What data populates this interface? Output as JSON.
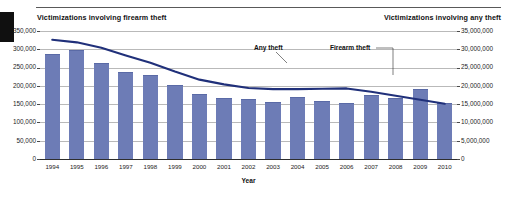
{
  "figure": {
    "left_axis_title": "Victimizations involving firearm theft",
    "right_axis_title": "Victimizations involving any theft",
    "xlabel": "Year",
    "annotations": {
      "line_series": "Any theft",
      "bar_series": "Firearm theft"
    },
    "colors": {
      "bar": "#6d7cb6",
      "line": "#20307a",
      "grid": "#b9b9b9",
      "axis": "#2e2e2e",
      "text": "#111111"
    }
  },
  "chart_data": {
    "type": "bar",
    "title": "",
    "xlabel": "Year",
    "categories": [
      "1994",
      "1995",
      "1996",
      "1997",
      "1998",
      "1999",
      "2000",
      "2001",
      "2002",
      "2003",
      "2004",
      "2005",
      "2006",
      "2007",
      "2008",
      "2009",
      "2010"
    ],
    "grid": true,
    "legend_position": "inline-annotation",
    "series": [
      {
        "name": "Firearm theft",
        "type": "bar",
        "axis": "left",
        "ylabel": "Victimizations involving firearm theft",
        "ylim": [
          0,
          350000
        ],
        "ytick_labels": [
          "0",
          "50,000",
          "100,000",
          "150,000",
          "200,000",
          "250,000",
          "300,000",
          "350,000"
        ],
        "ytick_values": [
          0,
          50000,
          100000,
          150000,
          200000,
          250000,
          300000,
          350000
        ],
        "values": [
          288000,
          297000,
          262000,
          237000,
          231000,
          202000,
          178000,
          167000,
          164000,
          155000,
          170000,
          158000,
          153000,
          174000,
          168000,
          192000,
          152000
        ]
      },
      {
        "name": "Any theft",
        "type": "line",
        "axis": "right",
        "ylabel": "Victimizations involving any theft",
        "ylim": [
          0,
          35000000
        ],
        "ytick_labels": [
          "0",
          "5,000,000",
          "10,000,000",
          "15,000,000",
          "20,000,000",
          "25,000,000",
          "30,000,000",
          "35,000,000"
        ],
        "ytick_values": [
          0,
          5000000,
          10000000,
          15000000,
          20000000,
          25000000,
          30000000,
          35000000
        ],
        "values": [
          32600000,
          31900000,
          30400000,
          28300000,
          26300000,
          23900000,
          21700000,
          20400000,
          19400000,
          19100000,
          19100000,
          19200000,
          19300000,
          18400000,
          17300000,
          16200000,
          15100000
        ]
      }
    ]
  }
}
